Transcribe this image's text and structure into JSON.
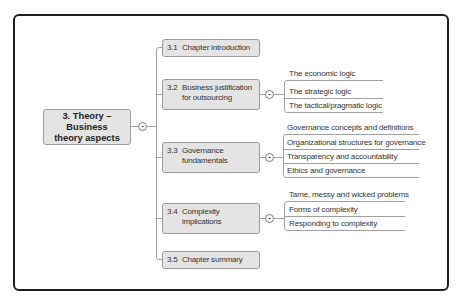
{
  "root": {
    "line1": "3. Theory – Business",
    "line2": "theory aspects",
    "collapse_symbol": "-"
  },
  "sections": [
    {
      "num": "3.1",
      "line1": "Chapter introduction",
      "line2": ""
    },
    {
      "num": "3.2",
      "line1": "Business justification",
      "line2": "for outsourcing",
      "collapse_symbol": "-",
      "children": [
        "The economic logic",
        "The strategic logic",
        "The tactical/pragmatic logic"
      ]
    },
    {
      "num": "3.3",
      "line1": "Governance",
      "line2": "fundamentals",
      "collapse_symbol": "-",
      "children": [
        "Governance concepts and definitions",
        "Organizational structures for governance",
        "Transparency and accountability",
        "Ethics and governance"
      ]
    },
    {
      "num": "3.4",
      "line1": "Complexity",
      "line2": "implications",
      "collapse_symbol": "-",
      "children": [
        "Tame, messy and wicked problems",
        "Forms of complexity",
        "Responding to complexity"
      ]
    },
    {
      "num": "3.5",
      "line1": "Chapter summary",
      "line2": ""
    }
  ],
  "colors": {
    "node_fill": "#e4e4e4",
    "node_border": "#9a9a9a",
    "connector": "#9a9a9a",
    "frame": "#1e1e1e"
  }
}
